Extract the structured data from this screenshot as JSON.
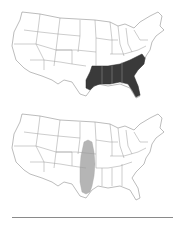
{
  "figure": {
    "maps": [
      {
        "id": "top",
        "description": "Contiguous United States outline map with southeastern states shaded",
        "highlight_color": "#3a3a3a",
        "highlighted_region": "Southeastern US (East Texas, Louisiana, Arkansas south, Mississippi, Alabama, Georgia, South Carolina, North Carolina, north Florida)"
      },
      {
        "id": "bottom",
        "description": "Contiguous United States outline map with a north-south band shaded",
        "highlight_color": "#b5b5b5",
        "highlighted_region": "Central band through Kansas, Oklahoma and central Texas"
      }
    ],
    "rule_color": "#8a8a8a",
    "outline_color": "#9a9a9a"
  }
}
